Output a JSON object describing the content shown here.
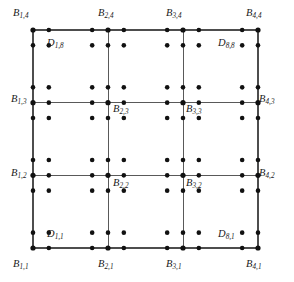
{
  "figure": {
    "kind": "mesh-grid-diagram",
    "colors": {
      "background": "#ffffff",
      "grid_line": "#595959",
      "outer_line": "#4d4d4d",
      "dot": "#111111",
      "label_text": "#1a1a1a"
    },
    "geometry": {
      "grid_left": 33,
      "grid_top": 30,
      "grid_right": 258,
      "grid_bottom": 248,
      "cells_x": 3,
      "cells_y": 3,
      "dots_x": 8,
      "dots_y": 8,
      "dot_radius": 2.3,
      "node_radius": 2.6
    }
  },
  "chart_data": {
    "type": "scatter",
    "title": "",
    "xlabel": "",
    "ylabel": "",
    "grid": true,
    "legend": "none",
    "xlim": [
      0,
      3
    ],
    "ylim": [
      0,
      3
    ],
    "vertical_grid_x": [
      0,
      1,
      2,
      3
    ],
    "horizontal_grid_y": [
      0,
      1,
      2,
      3
    ],
    "dot_x": [
      0.0,
      0.211,
      0.789,
      1.0,
      1.211,
      1.789,
      2.0,
      2.211,
      2.789,
      3.0
    ],
    "dot_y": [
      0.0,
      0.211,
      0.789,
      1.0,
      1.211,
      1.789,
      2.0,
      2.211,
      2.789,
      3.0
    ],
    "series": [
      {
        "name": "D sample points",
        "marker": "filled-circle",
        "count": 100
      },
      {
        "name": "B nodes",
        "marker": "filled-circle",
        "count": 16
      }
    ]
  },
  "labels": {
    "b_nodes": [
      {
        "name": "B",
        "sub": "1,4",
        "x": 13,
        "y": 8,
        "anchor": "outside-top-left"
      },
      {
        "name": "B",
        "sub": "2,4",
        "x": 98,
        "y": 8,
        "anchor": "outside-top"
      },
      {
        "name": "B",
        "sub": "3,4",
        "x": 166,
        "y": 8,
        "anchor": "outside-top"
      },
      {
        "name": "B",
        "sub": "4,4",
        "x": 246,
        "y": 8,
        "anchor": "outside-top-right"
      },
      {
        "name": "B",
        "sub": "1,3",
        "x": 11,
        "y": 94,
        "anchor": "outside-left"
      },
      {
        "name": "B",
        "sub": "2,3",
        "x": 113,
        "y": 104,
        "anchor": "inside"
      },
      {
        "name": "B",
        "sub": "3,3",
        "x": 186,
        "y": 104,
        "anchor": "inside"
      },
      {
        "name": "B",
        "sub": "4,3",
        "x": 259,
        "y": 94,
        "anchor": "outside-right"
      },
      {
        "name": "B",
        "sub": "1,2",
        "x": 11,
        "y": 168,
        "anchor": "outside-left"
      },
      {
        "name": "B",
        "sub": "2,2",
        "x": 113,
        "y": 178,
        "anchor": "inside"
      },
      {
        "name": "B",
        "sub": "3,2",
        "x": 186,
        "y": 178,
        "anchor": "inside"
      },
      {
        "name": "B",
        "sub": "4,2",
        "x": 259,
        "y": 168,
        "anchor": "outside-right"
      },
      {
        "name": "B",
        "sub": "1,1",
        "x": 13,
        "y": 259,
        "anchor": "outside-bottom-left"
      },
      {
        "name": "B",
        "sub": "2,1",
        "x": 98,
        "y": 259,
        "anchor": "outside-bottom"
      },
      {
        "name": "B",
        "sub": "3,1",
        "x": 166,
        "y": 259,
        "anchor": "outside-bottom"
      },
      {
        "name": "B",
        "sub": "4,1",
        "x": 246,
        "y": 259,
        "anchor": "outside-bottom-right"
      }
    ],
    "d_nodes": [
      {
        "name": "D",
        "sub": "1,8",
        "x": 47,
        "y": 38,
        "anchor": "inside-top-left"
      },
      {
        "name": "D",
        "sub": "8,8",
        "x": 218,
        "y": 38,
        "anchor": "inside-top-right"
      },
      {
        "name": "D",
        "sub": "1,1",
        "x": 47,
        "y": 229,
        "anchor": "inside-bottom-left"
      },
      {
        "name": "D",
        "sub": "8,1",
        "x": 218,
        "y": 229,
        "anchor": "inside-bottom-right"
      }
    ]
  }
}
